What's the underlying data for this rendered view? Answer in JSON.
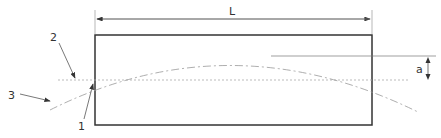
{
  "diagram": {
    "dimension_length_label": "L",
    "dimension_offset_label": "a",
    "callouts": [
      {
        "id": "1",
        "label": "1"
      },
      {
        "id": "2",
        "label": "2"
      },
      {
        "id": "3",
        "label": "3"
      }
    ],
    "colors": {
      "outline": "#333333",
      "dim_line": "#777777",
      "dash_line": "#999999"
    }
  }
}
